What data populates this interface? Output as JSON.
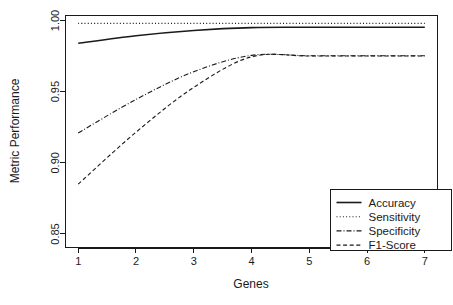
{
  "chart_data": {
    "type": "line",
    "title": "",
    "xlabel": "Genes",
    "ylabel": "Metric Performance",
    "xlim": [
      0.78,
      7.22
    ],
    "ylim": [
      0.8405,
      1.0035
    ],
    "xticks": [
      1,
      2,
      3,
      4,
      5,
      6,
      7
    ],
    "xtick_labels": [
      "1",
      "2",
      "3",
      "4",
      "5",
      "6",
      "7"
    ],
    "yticks": [
      0.85,
      0.9,
      0.95,
      1.0
    ],
    "ytick_labels": [
      "0.85",
      "0.90",
      "0.95",
      "1.00"
    ],
    "grid": false,
    "legend_position": "bottom-right",
    "x": [
      1,
      2,
      3,
      4,
      5,
      6,
      7
    ],
    "series": [
      {
        "name": "Accuracy",
        "linestyle": "solid",
        "color": "#1a1a1a",
        "values": [
          0.984,
          0.9893,
          0.993,
          0.995,
          0.9952,
          0.9952,
          0.9952
        ]
      },
      {
        "name": "Sensitivity",
        "linestyle": "dotted",
        "color": "#1a1a1a",
        "values": [
          0.998,
          0.998,
          0.998,
          0.998,
          0.998,
          0.998,
          0.998
        ]
      },
      {
        "name": "Specificity",
        "linestyle": "dashdot",
        "color": "#1a1a1a",
        "values": [
          0.921,
          0.9445,
          0.964,
          0.9755,
          0.9752,
          0.9752,
          0.9752
        ]
      },
      {
        "name": "F1-Score",
        "linestyle": "dashed",
        "color": "#1a1a1a",
        "values": [
          0.885,
          0.9215,
          0.953,
          0.9745,
          0.975,
          0.975,
          0.975
        ]
      }
    ]
  },
  "legend": {
    "entries": [
      {
        "label": "Accuracy"
      },
      {
        "label": "Sensitivity"
      },
      {
        "label": "Specificity"
      },
      {
        "label": "F1-Score"
      }
    ]
  },
  "axes": {
    "x_title": "Genes",
    "y_title": "Metric Performance"
  }
}
